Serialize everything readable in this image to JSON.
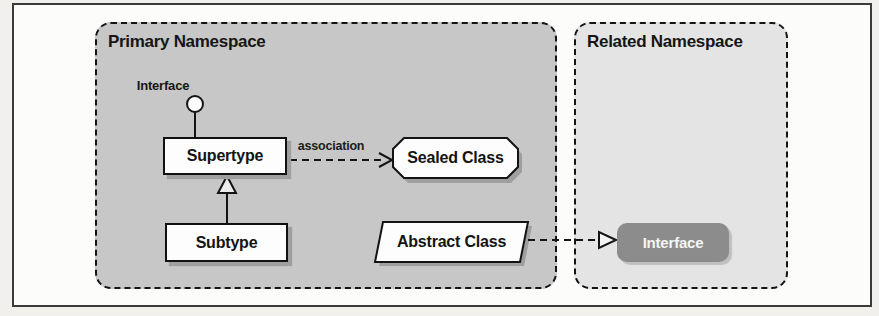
{
  "diagram": {
    "primary_namespace": {
      "title": "Primary Namespace",
      "lollipop_interface": {
        "label": "Interface"
      },
      "supertype": {
        "label": "Supertype"
      },
      "subtype": {
        "label": "Subtype"
      },
      "sealed_class": {
        "label": "Sealed Class"
      },
      "abstract_class": {
        "label": "Abstract Class"
      },
      "association_edge": {
        "label": "association"
      }
    },
    "related_namespace": {
      "title": "Related Namespace",
      "interface_node": {
        "label": "Interface"
      }
    },
    "colors": {
      "primary_namespace_fill": "#c7c7c7",
      "related_namespace_fill": "#e4e4e4",
      "interface_node_fill": "#8c8c8c",
      "node_fill": "#fdfdfd",
      "line_color": "#141414",
      "shadow_color": "#9f9f9f"
    }
  }
}
